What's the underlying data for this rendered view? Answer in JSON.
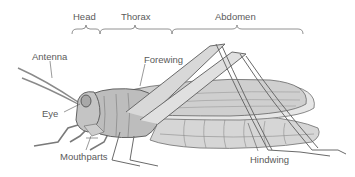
{
  "diagram": {
    "regions": [
      {
        "label": "Head"
      },
      {
        "label": "Thorax"
      },
      {
        "label": "Abdomen"
      }
    ],
    "parts": [
      {
        "label": "Antenna"
      },
      {
        "label": "Forewing"
      },
      {
        "label": "Eye"
      },
      {
        "label": "Mouthparts"
      },
      {
        "label": "Hindwing"
      }
    ]
  }
}
